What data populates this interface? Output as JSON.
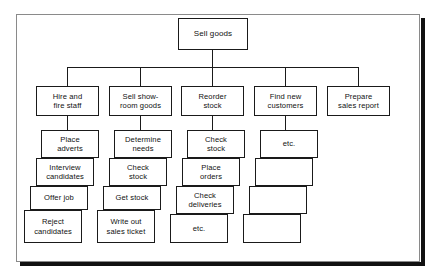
{
  "diagram": {
    "title": "Sell goods",
    "type": "hierarchical-task-analysis",
    "root": {
      "label": "Sell goods"
    },
    "level2": [
      {
        "label": "Hire and\nfire staff"
      },
      {
        "label": "Sell show-\nroom goods"
      },
      {
        "label": "Reorder\nstock"
      },
      {
        "label": "Find new\ncustomers"
      },
      {
        "label": "Prepare\nsales report"
      }
    ],
    "columns": [
      {
        "parent": "Hire and fire staff",
        "tasks": [
          {
            "label": "Place\nadverts"
          },
          {
            "label": "Interview\ncandidates"
          },
          {
            "label": "Offer job"
          },
          {
            "label": "Reject\ncandidates"
          }
        ]
      },
      {
        "parent": "Sell show-room goods",
        "tasks": [
          {
            "label": "Determine\nneeds"
          },
          {
            "label": "Check\nstock"
          },
          {
            "label": "Get stock"
          },
          {
            "label": "Write out\nsales ticket"
          }
        ]
      },
      {
        "parent": "Reorder stock",
        "tasks": [
          {
            "label": "Check\nstock"
          },
          {
            "label": "Place\norders"
          },
          {
            "label": "Check\ndeliveries"
          },
          {
            "label": "etc."
          }
        ]
      },
      {
        "parent": "Find new customers",
        "tasks": [
          {
            "label": "etc."
          },
          {
            "label": ""
          },
          {
            "label": ""
          },
          {
            "label": ""
          }
        ]
      },
      {
        "parent": "Prepare sales report",
        "tasks": []
      }
    ]
  },
  "colors": {
    "line": "#1a1a1a",
    "frame": "#8a8a8a",
    "shadow": "#111111",
    "box_fill": "#ffffff",
    "text": "#111111"
  }
}
